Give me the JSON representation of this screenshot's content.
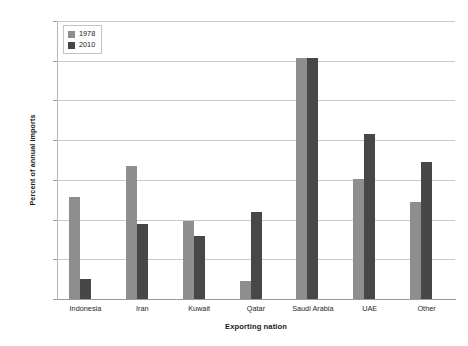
{
  "chart_data": {
    "type": "bar",
    "title": "",
    "xlabel": "Exporting nation",
    "ylabel": "Percent of annual imports",
    "categories": [
      "Indonesia",
      "Iran",
      "Kuwait",
      "Qatar",
      "Saudi Arabia",
      "UAE",
      "Other"
    ],
    "series": [
      {
        "name": "1978",
        "color": "#8e8e8e",
        "values": [
          12.8,
          16.8,
          9.8,
          2.3,
          30.3,
          15.1,
          12.2
        ]
      },
      {
        "name": "2010",
        "color": "#474747",
        "values": [
          2.5,
          9.5,
          7.9,
          11.0,
          30.3,
          20.8,
          17.2
        ]
      }
    ],
    "ylim": [
      0,
      35
    ],
    "ytick_values": [
      0,
      5,
      10,
      15,
      20,
      25,
      30,
      35
    ],
    "ytick_labels": [
      "0",
      "5",
      "10",
      "15",
      "20",
      "25",
      "30",
      "35"
    ],
    "grid": "horizontal",
    "legend_position": "top-left-inside",
    "background": "#ffffff"
  }
}
